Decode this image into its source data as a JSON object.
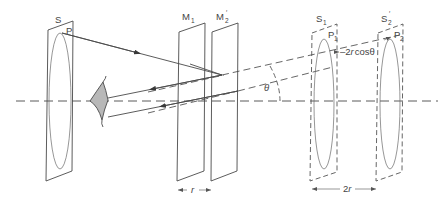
{
  "figure": {
    "type": "Michelson interferometer equivalent geometry diagram",
    "colors": {
      "line": "#4a4a4a",
      "eye_fill": "#b8b8b8",
      "background": "#ffffff"
    }
  },
  "labels": {
    "source": "S",
    "source_point": "P",
    "mirror1": "M",
    "mirror1_sub": "1",
    "mirror2": "M",
    "mirror2_sub": "2",
    "mirror2_prime": "′",
    "image1": "S",
    "image1_sub": "1",
    "image1_point": "P",
    "image1_point_sub": "1",
    "image2": "S",
    "image2_sub": "2",
    "image2_prime": "′",
    "image2_point": "P",
    "image2_point_sub": "2",
    "angle": "θ",
    "path_diff": "2r cos θ",
    "path_diff_prefix": "2",
    "path_diff_r": "r",
    "path_diff_cos": "cos",
    "path_diff_theta": "θ",
    "mirror_sep": "r",
    "image_sep_prefix": "2",
    "image_sep_r": "r"
  },
  "components": [
    {
      "id": "extended-source-S",
      "kind": "plate-with-ellipse",
      "style": "solid"
    },
    {
      "id": "observer-eye",
      "kind": "eye-lens",
      "style": "shaded"
    },
    {
      "id": "mirror-M1",
      "kind": "plate",
      "style": "solid"
    },
    {
      "id": "mirror-M2-prime",
      "kind": "plate",
      "style": "solid"
    },
    {
      "id": "virtual-source-S1",
      "kind": "plate-with-ellipse",
      "style": "dashed"
    },
    {
      "id": "virtual-source-S2-prime",
      "kind": "plate-with-ellipse",
      "style": "dashed"
    }
  ],
  "dimensions": [
    {
      "id": "mirror-separation",
      "label": "r"
    },
    {
      "id": "image-separation",
      "label": "2r"
    },
    {
      "id": "path-difference",
      "label": "2r cos θ"
    }
  ]
}
